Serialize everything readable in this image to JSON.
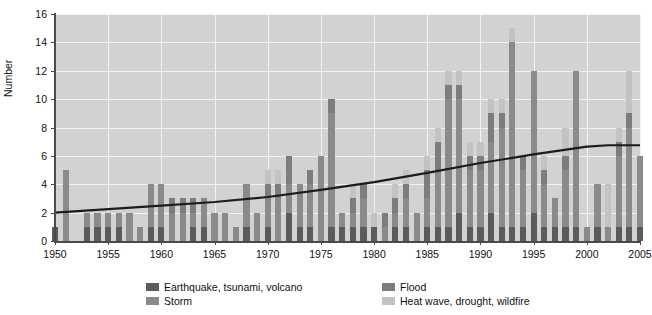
{
  "chart_data": {
    "type": "bar",
    "title": "",
    "subtitle": "",
    "xlabel": "",
    "ylabel": "Number",
    "ylim": [
      0,
      16
    ],
    "xlim": [
      1950,
      2005
    ],
    "grid": true,
    "stacked": true,
    "legend_position": "bottom",
    "y_ticks": [
      0,
      2,
      4,
      6,
      8,
      10,
      12,
      14,
      16
    ],
    "x_ticks": [
      1950,
      1955,
      1960,
      1965,
      1970,
      1975,
      1980,
      1985,
      1990,
      1995,
      2000,
      2005
    ],
    "categories": [
      1950,
      1951,
      1952,
      1953,
      1954,
      1955,
      1956,
      1957,
      1958,
      1959,
      1960,
      1961,
      1962,
      1963,
      1964,
      1965,
      1966,
      1967,
      1968,
      1969,
      1970,
      1971,
      1972,
      1973,
      1974,
      1975,
      1976,
      1977,
      1978,
      1979,
      1980,
      1981,
      1982,
      1983,
      1984,
      1985,
      1986,
      1987,
      1988,
      1989,
      1990,
      1991,
      1992,
      1993,
      1994,
      1995,
      1996,
      1997,
      1998,
      1999,
      2000,
      2001,
      2002,
      2003,
      2004,
      2005
    ],
    "series": [
      {
        "name": "Earthquake, tsunami, volcano",
        "color": "#5b5b5b",
        "values": [
          1,
          0,
          0,
          1,
          1,
          1,
          1,
          0,
          0,
          1,
          1,
          0,
          0,
          1,
          1,
          0,
          0,
          0,
          1,
          0,
          1,
          0,
          2,
          1,
          1,
          0,
          1,
          1,
          1,
          1,
          1,
          0,
          1,
          1,
          0,
          1,
          1,
          1,
          2,
          1,
          1,
          2,
          1,
          1,
          1,
          2,
          1,
          1,
          1,
          1,
          0,
          1,
          0,
          1,
          1,
          1
        ]
      },
      {
        "name": "Storm",
        "color": "#8a8a8a",
        "values": [
          0,
          5,
          0,
          1,
          1,
          1,
          1,
          2,
          1,
          3,
          3,
          2,
          2,
          1,
          2,
          2,
          2,
          1,
          3,
          2,
          2,
          3,
          2,
          3,
          3,
          6,
          8,
          1,
          1,
          2,
          0,
          1,
          1,
          2,
          2,
          2,
          4,
          9,
          8,
          4,
          4,
          5,
          7,
          13,
          4,
          10,
          3,
          2,
          4,
          11,
          1,
          3,
          1,
          5,
          7,
          5
        ]
      },
      {
        "name": "Flood",
        "color": "#7d7d7d",
        "values": [
          0,
          0,
          0,
          0,
          0,
          0,
          0,
          0,
          0,
          0,
          0,
          1,
          1,
          1,
          0,
          0,
          0,
          0,
          0,
          0,
          1,
          1,
          2,
          0,
          1,
          0,
          1,
          0,
          1,
          1,
          0,
          1,
          1,
          1,
          0,
          2,
          2,
          1,
          1,
          1,
          1,
          2,
          1,
          0,
          1,
          0,
          1,
          0,
          1,
          0,
          0,
          0,
          0,
          1,
          1,
          0
        ]
      },
      {
        "name": "Heat wave, drought, wildfire",
        "color": "#c3c3c3",
        "values": [
          0,
          0,
          0,
          0,
          0,
          0,
          0,
          0,
          0,
          0,
          0,
          0,
          0,
          0,
          0,
          0,
          0,
          0,
          0,
          0,
          1,
          1,
          0,
          0,
          0,
          0,
          0,
          0,
          1,
          0,
          1,
          0,
          1,
          1,
          0,
          1,
          1,
          1,
          1,
          1,
          1,
          1,
          1,
          1,
          0,
          0,
          1,
          0,
          2,
          0,
          0,
          0,
          3,
          1,
          3,
          0
        ]
      }
    ],
    "trend_line": {
      "name": "trend",
      "color": "#1c1c1c",
      "points": [
        {
          "x": 1950,
          "y": 2.0
        },
        {
          "x": 1955,
          "y": 2.25
        },
        {
          "x": 1960,
          "y": 2.5
        },
        {
          "x": 1965,
          "y": 2.75
        },
        {
          "x": 1970,
          "y": 3.1
        },
        {
          "x": 1975,
          "y": 3.6
        },
        {
          "x": 1980,
          "y": 4.15
        },
        {
          "x": 1985,
          "y": 4.8
        },
        {
          "x": 1990,
          "y": 5.5
        },
        {
          "x": 1995,
          "y": 6.1
        },
        {
          "x": 2000,
          "y": 6.65
        },
        {
          "x": 2002,
          "y": 6.75
        },
        {
          "x": 2005,
          "y": 6.75
        }
      ]
    }
  },
  "legend": {
    "items": [
      {
        "label": "Earthquake, tsunami, volcano",
        "color": "#5b5b5b"
      },
      {
        "label": "Storm",
        "color": "#8a8a8a"
      },
      {
        "label": "Flood",
        "color": "#7d7d7d"
      },
      {
        "label": "Heat wave, drought, wildfire",
        "color": "#c3c3c3"
      }
    ]
  },
  "axes": {
    "y_title": "Number"
  },
  "colors": {
    "plot_background": "#d2d2d2",
    "gridline": "#f2f2f2",
    "axis": "#4a4a4a",
    "text": "#111111"
  }
}
